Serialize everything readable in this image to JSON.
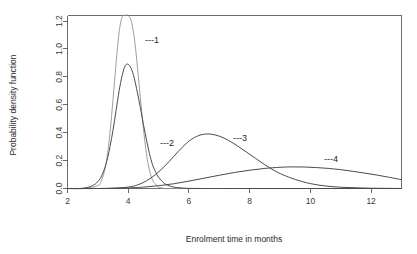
{
  "chart_data": {
    "type": "line",
    "title": "",
    "xlabel": "Enrolment time in months",
    "ylabel": "Probability density function",
    "xlim": [
      2,
      13
    ],
    "ylim": [
      0,
      1.24
    ],
    "grid": false,
    "legend_position": "inline-annotations",
    "xticks": [
      2,
      4,
      6,
      8,
      10,
      12
    ],
    "xtick_labels": [
      "2",
      "4",
      "6",
      "8",
      "10",
      "12"
    ],
    "yticks": [
      0.0,
      0.2,
      0.4,
      0.6,
      0.8,
      1.0,
      1.2
    ],
    "ytick_labels": [
      "0.0",
      "0.2",
      "0.4",
      "0.6",
      "0.8",
      "1.0",
      "1.2"
    ],
    "series": [
      {
        "name": "1",
        "label": "---1",
        "color": "#8c8c8c",
        "peak_x": 4.0,
        "peak_y": 1.24,
        "x": [
          2.0,
          2.5,
          3.0,
          3.1,
          3.2,
          3.3,
          3.4,
          3.5,
          3.6,
          3.7,
          3.8,
          3.9,
          4.0,
          4.1,
          4.2,
          4.3,
          4.4,
          4.5,
          4.6,
          4.7,
          4.8,
          4.9,
          5.0,
          5.2,
          5.4,
          5.6,
          6.0,
          6.5,
          7.0,
          8.0,
          9.0,
          10.0,
          11.0,
          12.0,
          13.0
        ],
        "values": [
          0.0,
          0.0,
          0.02,
          0.05,
          0.11,
          0.22,
          0.4,
          0.64,
          0.9,
          1.12,
          1.23,
          1.24,
          1.24,
          1.2,
          1.08,
          0.88,
          0.65,
          0.43,
          0.25,
          0.13,
          0.06,
          0.03,
          0.01,
          0.0,
          0.0,
          0.0,
          0.0,
          0.0,
          0.0,
          0.0,
          0.0,
          0.0,
          0.0,
          0.0,
          0.0
        ]
      },
      {
        "name": "2",
        "label": "---2",
        "color": "#4a4a4a",
        "peak_x": 4.0,
        "peak_y": 0.89,
        "x": [
          2.0,
          2.4,
          2.7,
          2.9,
          3.0,
          3.1,
          3.2,
          3.3,
          3.4,
          3.5,
          3.6,
          3.7,
          3.8,
          3.9,
          4.0,
          4.1,
          4.2,
          4.3,
          4.4,
          4.5,
          4.6,
          4.7,
          4.8,
          4.9,
          5.0,
          5.2,
          5.4,
          5.6,
          5.8,
          6.0,
          6.5,
          7.0,
          8.0,
          9.0,
          10.0,
          11.0,
          12.0,
          13.0
        ],
        "values": [
          0.0,
          0.0,
          0.01,
          0.03,
          0.05,
          0.08,
          0.13,
          0.2,
          0.3,
          0.42,
          0.56,
          0.7,
          0.81,
          0.88,
          0.89,
          0.86,
          0.79,
          0.69,
          0.58,
          0.46,
          0.35,
          0.25,
          0.17,
          0.12,
          0.08,
          0.035,
          0.015,
          0.007,
          0.003,
          0.001,
          0.0,
          0.0,
          0.0,
          0.0,
          0.0,
          0.0,
          0.0,
          0.0
        ]
      },
      {
        "name": "3",
        "label": "---3",
        "color": "#4a4a4a",
        "peak_x": 6.7,
        "peak_y": 0.39,
        "x": [
          2.0,
          3.0,
          3.5,
          4.0,
          4.3,
          4.6,
          4.9,
          5.2,
          5.5,
          5.8,
          6.1,
          6.4,
          6.7,
          7.0,
          7.3,
          7.6,
          7.9,
          8.2,
          8.5,
          8.8,
          9.1,
          9.5,
          10.0,
          10.5,
          11.0,
          11.5,
          12.0,
          12.5,
          13.0
        ],
        "values": [
          0.0,
          0.0,
          0.002,
          0.01,
          0.025,
          0.055,
          0.1,
          0.16,
          0.23,
          0.3,
          0.355,
          0.385,
          0.39,
          0.375,
          0.345,
          0.305,
          0.26,
          0.215,
          0.17,
          0.13,
          0.098,
          0.065,
          0.035,
          0.018,
          0.009,
          0.005,
          0.002,
          0.001,
          0.0
        ]
      },
      {
        "name": "4",
        "label": "---4",
        "color": "#4a4a4a",
        "peak_x": 9.4,
        "peak_y": 0.155,
        "x": [
          2.0,
          3.0,
          4.0,
          4.5,
          5.0,
          5.5,
          6.0,
          6.5,
          7.0,
          7.5,
          8.0,
          8.5,
          9.0,
          9.4,
          9.8,
          10.2,
          10.6,
          11.0,
          11.4,
          11.8,
          12.2,
          12.6,
          13.0
        ],
        "values": [
          0.0,
          0.0,
          0.004,
          0.01,
          0.02,
          0.034,
          0.053,
          0.074,
          0.095,
          0.115,
          0.131,
          0.144,
          0.152,
          0.155,
          0.154,
          0.15,
          0.144,
          0.135,
          0.123,
          0.11,
          0.096,
          0.08,
          0.063
        ]
      }
    ],
    "annotations": [
      {
        "text": "---1",
        "x": 4.55,
        "y": 1.06
      },
      {
        "text": "---2",
        "x": 5.05,
        "y": 0.325
      },
      {
        "text": "---3",
        "x": 7.45,
        "y": 0.36
      },
      {
        "text": "---4",
        "x": 10.45,
        "y": 0.205
      }
    ]
  }
}
